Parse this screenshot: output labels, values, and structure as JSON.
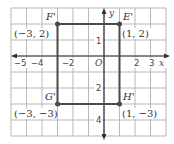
{
  "figure": {
    "type": "coordinate-plane",
    "grid": {
      "x_min": -6,
      "x_max": 4,
      "y_min": -5,
      "y_max": 3,
      "step": 1
    },
    "axes": {
      "x_label": "x",
      "y_label": "y",
      "origin_label": "O",
      "x_tick_labels": [
        {
          "value": -5,
          "label": "−5"
        },
        {
          "value": -4,
          "label": "−4"
        },
        {
          "value": -2,
          "label": "−2"
        },
        {
          "value": 2,
          "label": "2"
        },
        {
          "value": 3,
          "label": "3"
        }
      ],
      "y_tick_labels": [
        {
          "value": 1,
          "label": "1"
        },
        {
          "value": -2,
          "label": "2"
        },
        {
          "value": -4,
          "label": "4"
        }
      ]
    },
    "points": [
      {
        "name": "F'",
        "x": -3,
        "y": 2,
        "coord_label": "(−3, 2)"
      },
      {
        "name": "E'",
        "x": 1,
        "y": 2,
        "coord_label": "(1, 2)"
      },
      {
        "name": "G'",
        "x": -3,
        "y": -3,
        "coord_label": "(−3, −3)"
      },
      {
        "name": "H'",
        "x": 1,
        "y": -3,
        "coord_label": "(1, −3)"
      }
    ],
    "shape": "rectangle",
    "colors": {
      "grid": "#b0b0b0",
      "axis": "#333333",
      "shape": "#4a4a4a",
      "point": "#4a4a4a"
    }
  }
}
